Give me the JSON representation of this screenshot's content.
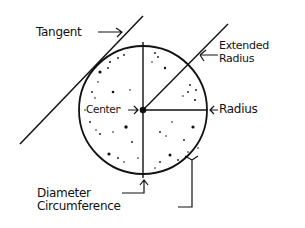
{
  "diagram": {
    "labels": {
      "tangent": "Tangent",
      "extended_radius_line1": "Extended",
      "extended_radius_line2": "Radius",
      "center": "Center",
      "radius": "Radius",
      "diameter": "Diameter",
      "circumference": "Circumference"
    },
    "colors": {
      "ink": "#111111",
      "background": "#ffffff"
    }
  }
}
